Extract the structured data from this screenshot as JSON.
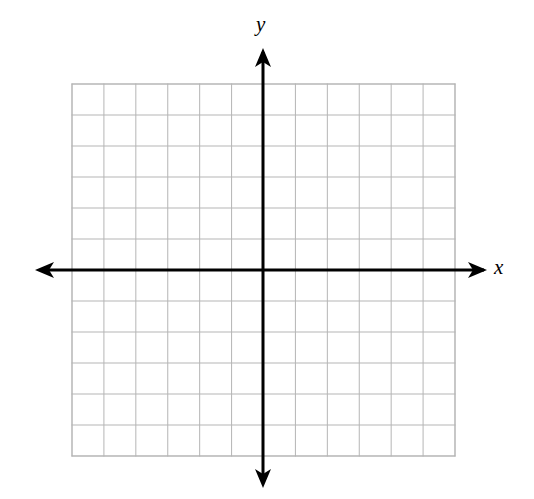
{
  "figure": {
    "title": "",
    "background_color": "#ffffff",
    "width": 534,
    "height": 499
  },
  "axes": {
    "x_label": "x",
    "y_label": "y",
    "axis_color": "#000000",
    "axis_line_width": 3,
    "arrowheads": [
      "left",
      "right",
      "up",
      "down"
    ],
    "origin": {
      "x": 263,
      "y": 270
    }
  },
  "grid": {
    "color": "#b5b5b5",
    "line_width": 1,
    "border_color": "#b5b5b5",
    "columns": 12,
    "rows": 12,
    "columns_left_of_y_axis": 6,
    "columns_right_of_y_axis": 6,
    "rows_above_x_axis": 6,
    "rows_below_x_axis": 6,
    "cell_width": 31.9,
    "cell_height": 31.0,
    "left": 72,
    "right": 455,
    "top": 84,
    "bottom": 456
  },
  "chart_data": {
    "type": "scatter",
    "title": "",
    "subtitle": "",
    "xlabel": "x",
    "ylabel": "y",
    "xlim": [
      -6,
      6
    ],
    "ylim": [
      -6,
      6
    ],
    "xticks": [
      -6,
      -5,
      -4,
      -3,
      -2,
      -1,
      0,
      1,
      2,
      3,
      4,
      5,
      6
    ],
    "yticks": [
      -6,
      -5,
      -4,
      -3,
      -2,
      -1,
      0,
      1,
      2,
      3,
      4,
      5,
      6
    ],
    "xticklabels": [
      "",
      "",
      "",
      "",
      "",
      "",
      "",
      "",
      "",
      "",
      "",
      "",
      ""
    ],
    "yticklabels": [
      "",
      "",
      "",
      "",
      "",
      "",
      "",
      "",
      "",
      "",
      "",
      "",
      ""
    ],
    "grid": true,
    "legend": null,
    "legend_position": "none",
    "annotations": [],
    "series": [],
    "x": [],
    "y": []
  }
}
